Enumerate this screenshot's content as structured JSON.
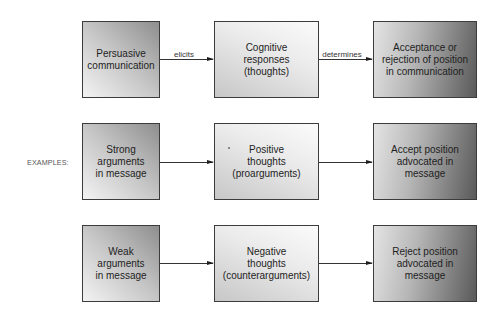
{
  "diagram": {
    "type": "flow",
    "rows": [
      {
        "label": "",
        "boxes": [
          {
            "text": "Persuasive\ncommunication"
          },
          {
            "text": "Cognitive\nresponses\n(thoughts)"
          },
          {
            "text": "Acceptance or\nrejection of position\nin communication"
          }
        ],
        "edges": [
          {
            "from": 0,
            "to": 1,
            "label": "elicits"
          },
          {
            "from": 1,
            "to": 2,
            "label": "determines"
          }
        ]
      },
      {
        "label": "EXAMPLES:",
        "boxes": [
          {
            "text": "Strong\narguments\nin message"
          },
          {
            "text": "Positive\nthoughts\n(proarguments)"
          },
          {
            "text": "Accept position\nadvocated in\nmessage"
          }
        ],
        "edges": [
          {
            "from": 0,
            "to": 1,
            "label": ""
          },
          {
            "from": 1,
            "to": 2,
            "label": ""
          }
        ]
      },
      {
        "label": "",
        "boxes": [
          {
            "text": "Weak\narguments\nin message"
          },
          {
            "text": "Negative\nthoughts\n(counterarguments)"
          },
          {
            "text": "Reject position\nadvocated in\nmessage"
          }
        ],
        "edges": [
          {
            "from": 0,
            "to": 1,
            "label": ""
          },
          {
            "from": 1,
            "to": 2,
            "label": ""
          }
        ]
      }
    ]
  },
  "colors": {
    "border": "#3c3c3c",
    "text": "#1e1e1e",
    "arrow": "#333333",
    "label": "#555555"
  }
}
